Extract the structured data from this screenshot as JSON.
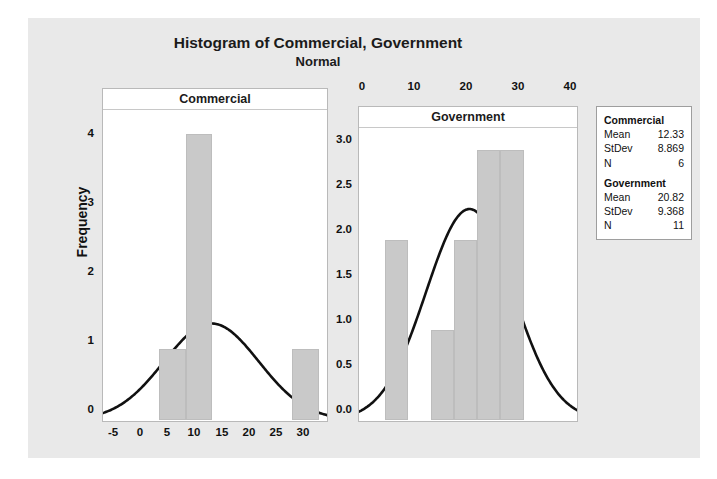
{
  "figure": {
    "title": "Histogram of Commercial, Government",
    "subtitle": "Normal",
    "ylabel": "Frequency"
  },
  "panels": {
    "left": {
      "title": "Commercial",
      "xticks": [
        "-5",
        "0",
        "5",
        "10",
        "15",
        "20",
        "25",
        "30"
      ],
      "yticks": [
        "0",
        "1",
        "2",
        "3",
        "4"
      ]
    },
    "right": {
      "title": "Government",
      "xticks": [
        "0",
        "10",
        "20",
        "30",
        "40"
      ],
      "yticks": [
        "0.0",
        "0.5",
        "1.0",
        "1.5",
        "2.0",
        "2.5",
        "3.0"
      ]
    }
  },
  "stats": {
    "groups": [
      {
        "name": "Commercial",
        "rows": [
          {
            "key": "Mean",
            "value": "12.33"
          },
          {
            "key": "StDev",
            "value": "8.869"
          },
          {
            "key": "N",
            "value": "6"
          }
        ]
      },
      {
        "name": "Government",
        "rows": [
          {
            "key": "Mean",
            "value": "20.82"
          },
          {
            "key": "StDev",
            "value": "9.368"
          },
          {
            "key": "N",
            "value": "11"
          }
        ]
      }
    ]
  },
  "chart_data": {
    "type": "bar",
    "title": "Histogram of Commercial, Government",
    "subtitle": "Normal",
    "ylabel": "Frequency",
    "xlabel": "",
    "grid": false,
    "legend": false,
    "panels": [
      {
        "name": "Commercial",
        "type": "histogram-with-normal-curve",
        "xlim": [
          -8,
          34
        ],
        "ylim": [
          0,
          4.35
        ],
        "xticks": [
          -5,
          0,
          5,
          10,
          15,
          20,
          25,
          30
        ],
        "yticks": [
          0,
          1,
          2,
          3,
          4
        ],
        "bin_width": 5,
        "bins": [
          {
            "start": 2.5,
            "end": 7.5,
            "center": 5,
            "frequency": 1
          },
          {
            "start": 7.5,
            "end": 12.5,
            "center": 10,
            "frequency": 4
          },
          {
            "start": 27.5,
            "end": 32.5,
            "center": 30,
            "frequency": 1
          }
        ],
        "normal_curve": {
          "mean": 12.33,
          "stdev": 8.869,
          "n": 6,
          "peak_frequency": 1.35
        }
      },
      {
        "name": "Government",
        "type": "histogram-with-normal-curve",
        "xlim": [
          -3,
          44
        ],
        "ylim": [
          0,
          3.25
        ],
        "xticks": [
          0,
          10,
          20,
          30,
          40
        ],
        "yticks": [
          0.0,
          0.5,
          1.0,
          1.5,
          2.0,
          2.5,
          3.0
        ],
        "bin_width": 5,
        "bins": [
          {
            "start": 2.5,
            "end": 7.5,
            "center": 5,
            "frequency": 2
          },
          {
            "start": 12.5,
            "end": 17.5,
            "center": 15,
            "frequency": 1
          },
          {
            "start": 17.5,
            "end": 22.5,
            "center": 20,
            "frequency": 2
          },
          {
            "start": 22.5,
            "end": 27.5,
            "center": 25,
            "frequency": 3
          },
          {
            "start": 27.5,
            "end": 32.5,
            "center": 30,
            "frequency": 3
          }
        ],
        "normal_curve": {
          "mean": 20.82,
          "stdev": 9.368,
          "n": 11,
          "peak_frequency": 2.34
        }
      }
    ]
  }
}
